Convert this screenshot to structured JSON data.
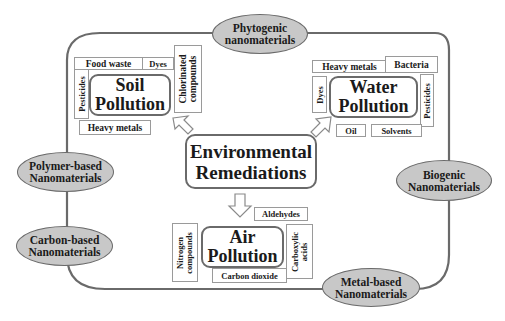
{
  "center": {
    "line1": "Environmental",
    "line2": "Remediations"
  },
  "nanomaterials": {
    "phytogenic": {
      "line1": "Phytogenic",
      "line2": "nanomaterials"
    },
    "polymer": {
      "line1": "Polymer-based",
      "line2": "Nanomaterials"
    },
    "carbon": {
      "line1": "Carbon-based",
      "line2": "Nanomaterials"
    },
    "biogenic": {
      "line1": "Biogenic",
      "line2": "Nanomaterials"
    },
    "metal": {
      "line1": "Metal-based",
      "line2": "Nanomaterials"
    }
  },
  "soil": {
    "line1": "Soil",
    "line2": "Pollution",
    "tags": {
      "food_waste": "Food waste",
      "dyes": "Dyes",
      "chlorinated_1": "Chlorinated",
      "chlorinated_2": "compounds",
      "pesticides": "Pesticides",
      "heavy_metals": "Heavy metals"
    }
  },
  "water": {
    "line1": "Water",
    "line2": "Pollution",
    "tags": {
      "heavy_metals": "Heavy metals",
      "bacteria": "Bacteria",
      "dyes": "Dyes",
      "pesticides": "Pesticides",
      "oil": "Oil",
      "solvents": "Solvents"
    }
  },
  "air": {
    "line1": "Air",
    "line2": "Pollution",
    "tags": {
      "aldehydes": "Aldehydes",
      "nitrogen_1": "Nitrogen",
      "nitrogen_2": "compounds",
      "carboxylic_1": "Carboxylic",
      "carboxylic_2": "acids",
      "carbon_dioxide": "Carbon dioxide"
    }
  },
  "colors": {
    "ellipse_fill": "#c8c8c8",
    "stroke": "#6a6a6a",
    "tag_border": "#9a9a9a"
  }
}
